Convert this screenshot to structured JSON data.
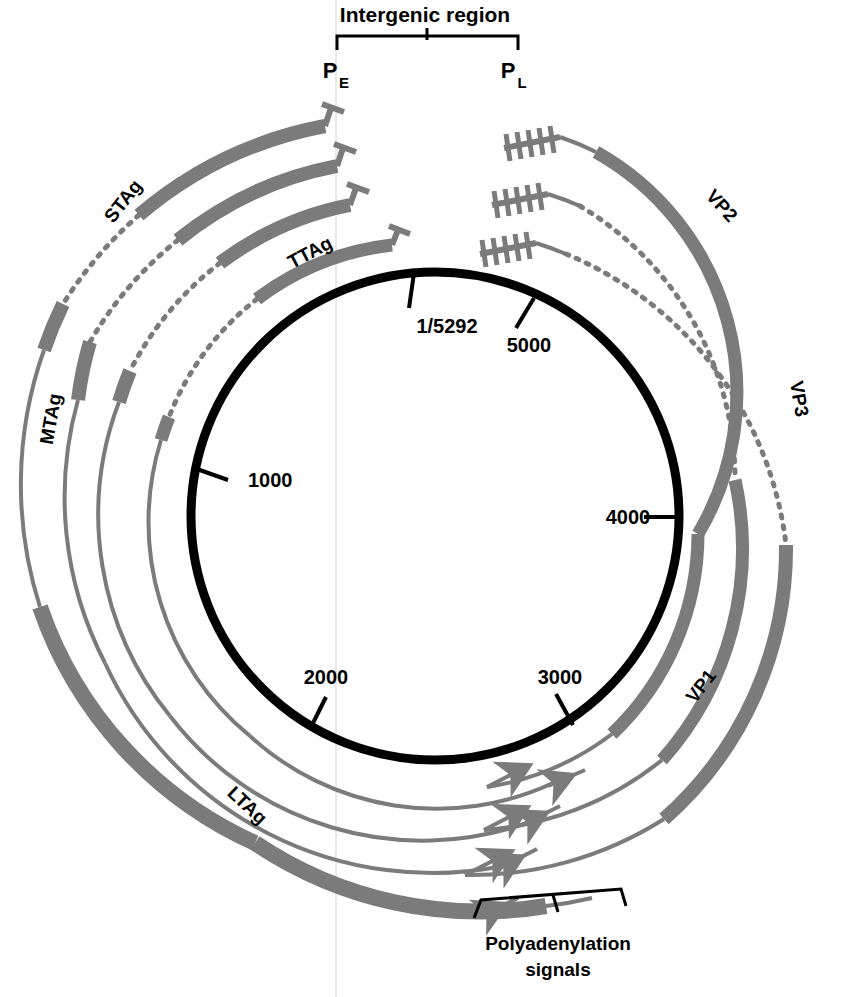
{
  "figure": {
    "kind": "circular-genome-map",
    "organism_genome_length": "5292",
    "background": "#ffffff",
    "ink_black": "#000000",
    "transcript_gray": "#7b7b7b",
    "line_gray": "#7b7b7b"
  },
  "annotations": {
    "intergenic_label": "Intergenic region",
    "polyadenylation_label_line1": "Polyadenylation",
    "polyadenylation_label_line2": "signals",
    "promoter_early": "P",
    "promoter_early_sub": "E",
    "promoter_late": "P",
    "promoter_late_sub": "L"
  },
  "genome_circle": {
    "center_x": 435,
    "center_y": 516,
    "radius": 244,
    "stroke_width": 9,
    "color": "#000000",
    "ticks": [
      {
        "label": "1/5292",
        "bp": 0,
        "angle_deg": -95,
        "label_x": 447,
        "label_y": 333,
        "tick_inner": 1.0,
        "tick_outer": 1.0
      },
      {
        "label": "5000",
        "bp": 5000,
        "angle_deg": -63,
        "label_x": 529,
        "label_y": 352,
        "tick_inner": 1.0,
        "tick_outer": 1.0
      },
      {
        "label": "4000",
        "bp": 4000,
        "angle_deg": 0,
        "label_x": 628,
        "label_y": 524,
        "tick_inner": 1.0,
        "tick_outer": 1.0
      },
      {
        "label": "3000",
        "bp": 3000,
        "angle_deg": 57,
        "label_x": 560,
        "label_y": 684,
        "tick_inner": 1.0,
        "tick_outer": 1.0
      },
      {
        "label": "2000",
        "bp": 2000,
        "angle_deg": 116,
        "label_x": 326,
        "label_y": 684,
        "tick_inner": 1.0,
        "tick_outer": 1.0
      },
      {
        "label": "1000",
        "bp": 1000,
        "angle_deg": 172,
        "label_x": 248,
        "label_y": 487,
        "tick_inner": 1.0,
        "tick_outer": 1.0
      }
    ]
  },
  "early_transcripts": {
    "direction": "counterclockwise",
    "start_promoter": "P_E",
    "cap_marker": "T-bar",
    "terminus_marker": "left-arrowhead",
    "items": [
      {
        "name": "TTAg",
        "radius": 276,
        "label_x": 313,
        "label_y": 258,
        "label_rot": -28
      },
      {
        "name": "STAg",
        "radius": 318,
        "label_x": 128,
        "label_y": 205,
        "label_rot": -52
      },
      {
        "name": "MTAg",
        "radius": 360,
        "label_x": 57,
        "label_y": 420,
        "label_rot": -80
      },
      {
        "name": "LTAg",
        "radius": 402,
        "label_x": 243,
        "label_y": 810,
        "label_rot": 43
      }
    ]
  },
  "late_transcripts": {
    "direction": "clockwise",
    "start_promoter": "P_L",
    "cap_marker": "leader-repeat-comb",
    "terminus_marker": "right-arrowhead",
    "items": [
      {
        "name": "VP2",
        "radius": 276,
        "label_x": 717,
        "label_y": 210,
        "label_rot": 48
      },
      {
        "name": "VP3",
        "radius": 318,
        "label_x": 793,
        "label_y": 400,
        "label_rot": 80
      },
      {
        "name": "VP1",
        "radius": 360,
        "label_x": 706,
        "label_y": 690,
        "label_rot": -52
      }
    ]
  },
  "legend_notes": {
    "thick_bar_means": "exon / coding region",
    "dotted_line_means": "intron (spliced out)",
    "thin_line_means": "non-coding transcript region"
  }
}
